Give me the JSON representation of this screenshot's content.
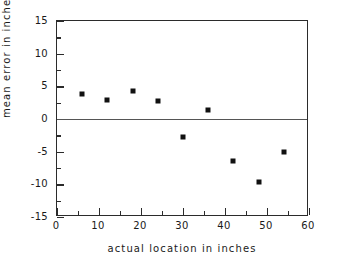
{
  "chart_data": {
    "type": "scatter",
    "title": "",
    "xlabel": "actual location in inches",
    "ylabel": "mean error in inches",
    "xlim": [
      0,
      60
    ],
    "ylim": [
      -15,
      15
    ],
    "xticks": [
      0,
      10,
      20,
      30,
      40,
      50,
      60
    ],
    "xtick_labels": [
      "0",
      "10",
      "20",
      "30",
      "40",
      "50",
      "60"
    ],
    "yticks": [
      15,
      10,
      5,
      0,
      -5,
      -10,
      -15
    ],
    "ytick_labels": [
      "15",
      "10",
      "5",
      "0",
      "-5",
      "-10",
      "-15"
    ],
    "x_minor_interval": 5,
    "y_minor_interval": 2.5,
    "grid": false,
    "legend": null,
    "reference_lines": [
      {
        "axis": "y",
        "value": 0,
        "color": "#555555"
      }
    ],
    "marker_style": "square",
    "marker_color": "#111111",
    "series": [
      {
        "name": "mean error",
        "x": [
          6,
          12,
          18,
          24,
          30,
          36,
          42,
          48,
          54
        ],
        "values": [
          3.8,
          2.9,
          4.3,
          2.7,
          -2.8,
          1.4,
          -6.4,
          -9.6,
          -5.0
        ]
      }
    ]
  }
}
